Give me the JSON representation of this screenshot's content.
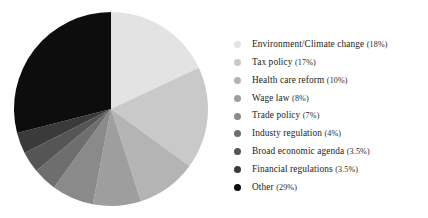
{
  "chart_data": {
    "type": "pie",
    "title": "",
    "subtitle": "",
    "xlabel": "",
    "ylabel": "",
    "grid": false,
    "legend_position": "right",
    "start_angle_deg": 0,
    "direction": "clockwise",
    "total_percent": 100,
    "categories": [
      "Environment/Climate change",
      "Tax policy",
      "Health care reform",
      "Wage law",
      "Trade policy",
      "Industy regulation",
      "Broad economic agenda",
      "Financial regulations",
      "Other"
    ],
    "values": [
      18,
      17,
      10,
      8,
      7,
      4,
      3.5,
      3.5,
      29
    ],
    "value_labels": [
      "18%",
      "17%",
      "10%",
      "8%",
      "7%",
      "4%",
      "3.5%",
      "3.5%",
      "29%"
    ],
    "colors": [
      "#e3e3e3",
      "#c9c9c9",
      "#b4b4b4",
      "#9e9e9e",
      "#8a8a8a",
      "#6e6e6e",
      "#555555",
      "#3a3a3a",
      "#0d0d0d"
    ]
  },
  "legend": {
    "items": [
      {
        "label": "Environment/Climate change",
        "percent": "(18%)",
        "color": "#e3e3e3"
      },
      {
        "label": "Tax policy",
        "percent": "(17%)",
        "color": "#c9c9c9"
      },
      {
        "label": "Health care reform",
        "percent": "(10%)",
        "color": "#b4b4b4"
      },
      {
        "label": "Wage law",
        "percent": "(8%)",
        "color": "#9e9e9e"
      },
      {
        "label": "Trade policy",
        "percent": "(7%)",
        "color": "#8a8a8a"
      },
      {
        "label": "Industy regulation",
        "percent": "(4%)",
        "color": "#6e6e6e"
      },
      {
        "label": "Broad economic agenda",
        "percent": "(3.5%)",
        "color": "#555555"
      },
      {
        "label": "Financial regulations",
        "percent": "(3.5%)",
        "color": "#3a3a3a"
      },
      {
        "label": "Other",
        "percent": "(29%)",
        "color": "#0d0d0d"
      }
    ]
  }
}
